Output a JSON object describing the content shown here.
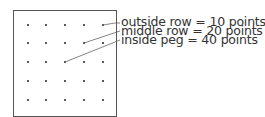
{
  "board": {
    "rows": 5,
    "cols": 5,
    "border_color": "#555555",
    "peg_color": "#333333"
  },
  "labels": [
    {
      "text": "outside row = 10 points",
      "row": 0,
      "col": 4
    },
    {
      "text": "middle row = 20 points",
      "row": 1,
      "col": 3
    },
    {
      "text": "inside peg = 40 points",
      "row": 2,
      "col": 2
    }
  ]
}
